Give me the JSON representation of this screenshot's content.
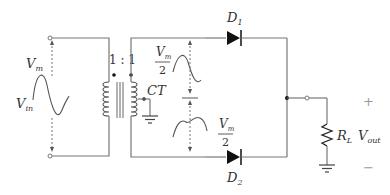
{
  "diagram": {
    "input": {
      "label_main": "V",
      "label_sub": "in",
      "amplitude_label_main": "V",
      "amplitude_label_sub": "m"
    },
    "transformer": {
      "ratio": "1 : 1",
      "center_tap_label": "CT"
    },
    "secondary_halves": {
      "top": {
        "numerator_main": "V",
        "numerator_sub": "m",
        "denominator": "2"
      },
      "bottom": {
        "numerator_main": "V",
        "numerator_sub": "m",
        "denominator": "2"
      }
    },
    "diodes": [
      {
        "label_main": "D",
        "label_sub": "1"
      },
      {
        "label_main": "D",
        "label_sub": "2"
      }
    ],
    "load": {
      "label_main": "R",
      "label_sub": "L"
    },
    "output": {
      "label_main": "V",
      "label_sub": "out",
      "plus": "+",
      "minus": "−"
    },
    "colors": {
      "wire": "#777777",
      "component": "#111111",
      "text": "#333333"
    }
  }
}
